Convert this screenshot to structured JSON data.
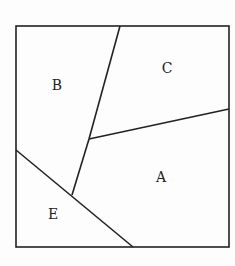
{
  "diagram": {
    "stroke_color": "#222222",
    "background": "#fdfdfd",
    "outer_square": {
      "x1": 16,
      "y1": 26,
      "x2": 229,
      "y2": 247
    },
    "segments": [
      {
        "name": "b-c-divider",
        "x1": 120,
        "y1": 26,
        "x2": 89,
        "y2": 139
      },
      {
        "name": "b-a-divider",
        "x1": 89,
        "y1": 139,
        "x2": 72,
        "y2": 195
      },
      {
        "name": "c-a-divider",
        "x1": 89,
        "y1": 139,
        "x2": 229,
        "y2": 109
      },
      {
        "name": "e-divider",
        "x1": 16,
        "y1": 150,
        "x2": 133,
        "y2": 247
      }
    ],
    "regions": [
      {
        "label": "A",
        "x": 161,
        "y": 182
      },
      {
        "label": "B",
        "x": 57,
        "y": 90
      },
      {
        "label": "C",
        "x": 167,
        "y": 73
      },
      {
        "label": "E",
        "x": 53,
        "y": 219
      }
    ]
  }
}
